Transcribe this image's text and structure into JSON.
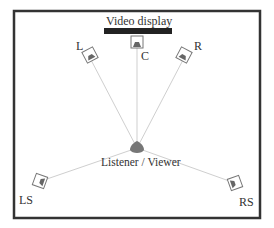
{
  "diagram": {
    "title": "Video display",
    "listener_label": "Listener / Viewer",
    "speakers": [
      {
        "id": "L",
        "label": "L"
      },
      {
        "id": "C",
        "label": "C"
      },
      {
        "id": "R",
        "label": "R"
      },
      {
        "id": "LS",
        "label": "LS"
      },
      {
        "id": "RS",
        "label": "RS"
      }
    ],
    "colors": {
      "frame": "#333333",
      "display": "#222222",
      "lines": "#cccccc",
      "speaker": "#666666"
    }
  }
}
